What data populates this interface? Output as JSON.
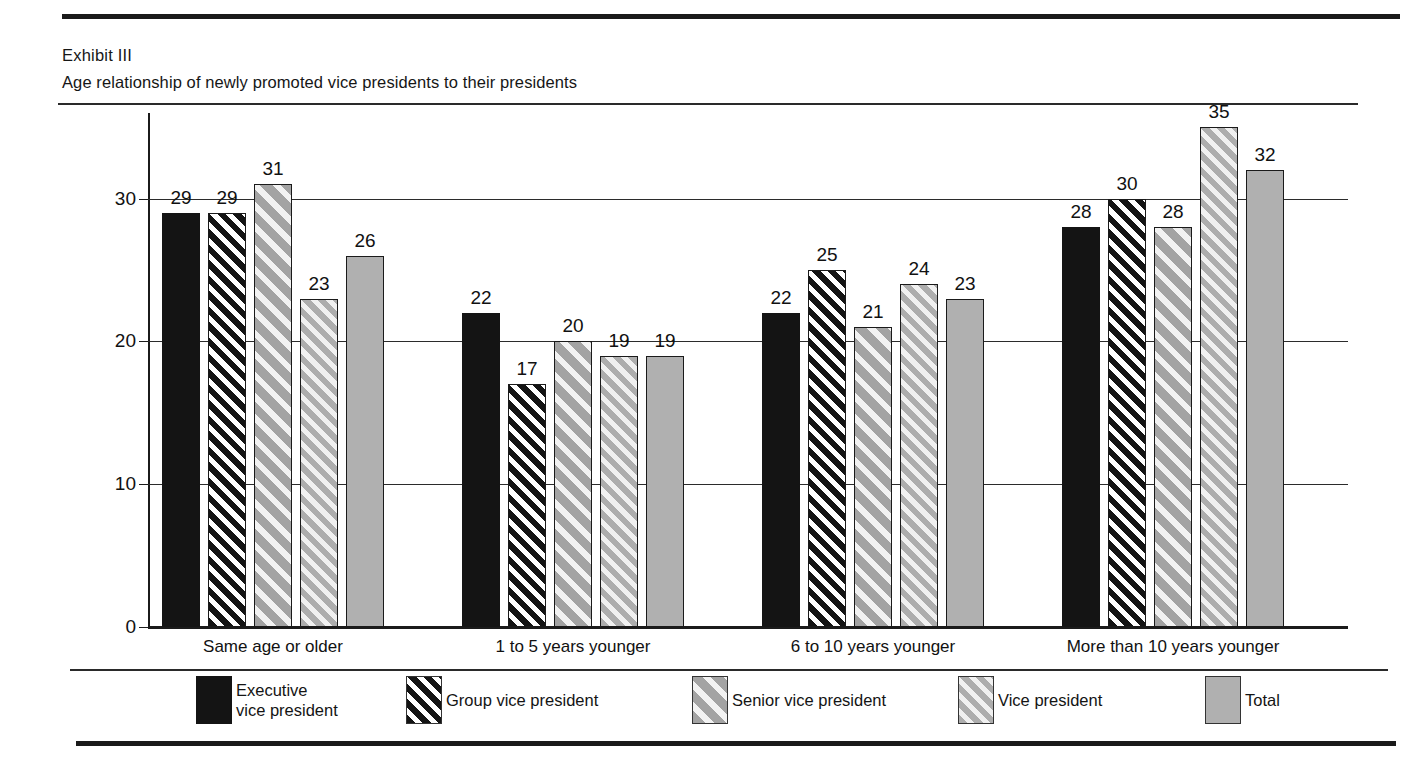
{
  "exhibit": {
    "label": "Exhibit III",
    "subtitle": "Age relationship of newly promoted vice presidents to their presidents"
  },
  "chart_data": {
    "type": "bar",
    "title": "Age relationship of newly promoted vice presidents to their presidents",
    "xlabel": "",
    "ylabel": "Percentage",
    "ylim": [
      0,
      36
    ],
    "yticks": [
      0,
      10,
      20,
      30
    ],
    "grid": true,
    "legend_position": "bottom",
    "categories": [
      "Same age or older",
      "1 to 5 years younger",
      "6 to 10 years younger",
      "More than 10 years younger"
    ],
    "series": [
      {
        "name": "Executive vice president",
        "pattern": "solid-black",
        "color": "#141414",
        "values": [
          29,
          22,
          22,
          28
        ]
      },
      {
        "name": "Group vice president",
        "pattern": "hatch-black",
        "color": "#141414",
        "values": [
          29,
          17,
          25,
          30
        ]
      },
      {
        "name": "Senior vice president",
        "pattern": "hatch-gray-wide",
        "color": "#a3a3a3",
        "values": [
          31,
          20,
          21,
          28
        ]
      },
      {
        "name": "Vice president",
        "pattern": "hatch-gray-fine",
        "color": "#adadad",
        "values": [
          23,
          19,
          24,
          35
        ]
      },
      {
        "name": "Total",
        "pattern": "solid-gray",
        "color": "#b0b0b0",
        "values": [
          26,
          19,
          23,
          32
        ]
      }
    ]
  },
  "legend": {
    "items": [
      {
        "label": "Executive\nvice president",
        "pattern": "solid-black"
      },
      {
        "label": "Group vice president",
        "pattern": "hatch-black"
      },
      {
        "label": "Senior vice president",
        "pattern": "hatch-gray-wide"
      },
      {
        "label": "Vice president",
        "pattern": "hatch-gray-fine"
      },
      {
        "label": "Total",
        "pattern": "solid-gray"
      }
    ]
  }
}
